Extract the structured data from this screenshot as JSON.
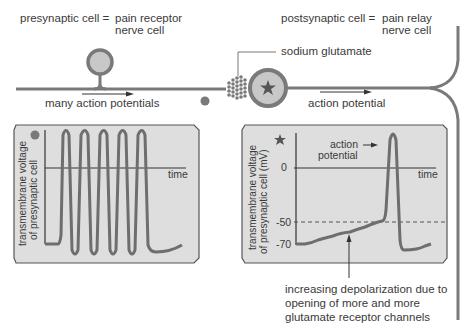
{
  "labels": {
    "presynaptic_term": "presynaptic cell =",
    "presynaptic_def_1": "pain receptor",
    "presynaptic_def_2": "nerve cell",
    "postsynaptic_term": "postsynaptic cell =",
    "postsynaptic_def_1": "pain relay",
    "postsynaptic_def_2": "nerve cell",
    "sodium_glutamate": "sodium glutamate",
    "many_action_potentials": "many action potentials",
    "action_potential": "action potential"
  },
  "left_panel": {
    "marker": "gray-dot",
    "ylabel_1": "transmembrane voltage",
    "ylabel_2": "of presynaptic cell",
    "xlabel": "time"
  },
  "right_panel": {
    "marker": "star",
    "ylabel_1": "transmembrane voltage",
    "ylabel_2": "of presynaptic cell (mV)",
    "xlabel": "time",
    "tick_0": "0",
    "tick_50": "-50",
    "tick_70": "-70",
    "annotation_1": "action",
    "annotation_2": "potential"
  },
  "caption": {
    "line_1": "increasing depolarization due to",
    "line_2": "opening of more and more",
    "line_3": "glutamate receptor  channels"
  },
  "colors": {
    "axon": "#7a7a7a",
    "panel_fill": "#dedede",
    "panel_border": "#555555",
    "trace": "#6e6e6e",
    "cell_fill": "#c8c8c8"
  }
}
